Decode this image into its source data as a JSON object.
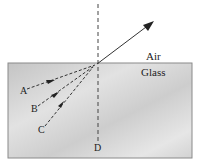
{
  "diagram": {
    "media": {
      "upper": "Air",
      "lower": "Glass"
    },
    "rays": [
      {
        "label": "A",
        "style": "dashed",
        "direction": "toward interface"
      },
      {
        "label": "B",
        "style": "dashed",
        "direction": "toward interface"
      },
      {
        "label": "C",
        "style": "dashed",
        "direction": "toward interface"
      }
    ],
    "normal": {
      "label": "D",
      "style": "dashed"
    },
    "refracted_ray": {
      "style": "solid",
      "medium": "Air"
    },
    "colors": {
      "glass_fill": "#cfcfcf",
      "glass_border": "#888888",
      "line": "#333333",
      "background": "#ffffff"
    }
  }
}
